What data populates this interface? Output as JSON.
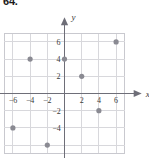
{
  "problem": {
    "number": "64."
  },
  "figure": {
    "name": "coordinate-plane-scatter-plot",
    "colors": {
      "grid": "#d8d8dc",
      "grid_outer": "#c9c9cf",
      "axis": "#6e6e78",
      "point": "#8a8a92",
      "text": "#3a3a3a"
    }
  },
  "chart_data": {
    "type": "scatter",
    "title": "",
    "xlabel": "x",
    "ylabel": "y",
    "xlim": [
      -8,
      8
    ],
    "ylim": [
      -8,
      8
    ],
    "grid": true,
    "legend": null,
    "xticks": [
      -6,
      -4,
      -2,
      2,
      4,
      6
    ],
    "yticks": [
      6,
      4,
      2,
      -2,
      -4
    ],
    "xtick_labels": [
      "-6",
      "-4",
      "-2",
      "2",
      "4",
      "6"
    ],
    "ytick_labels": [
      "6",
      "4",
      "2",
      "-2",
      "-4"
    ],
    "gridline_step": 2,
    "points": [
      {
        "x": -6,
        "y": -4
      },
      {
        "x": -4,
        "y": 4
      },
      {
        "x": -2,
        "y": -6
      },
      {
        "x": 0,
        "y": 4
      },
      {
        "x": 2,
        "y": 2
      },
      {
        "x": 4,
        "y": -2
      },
      {
        "x": 6,
        "y": 6
      }
    ]
  }
}
